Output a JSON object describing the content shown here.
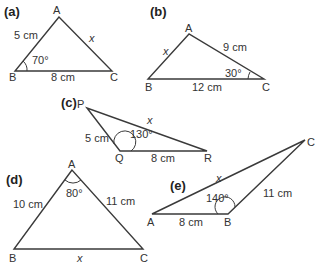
{
  "figures": [
    {
      "part": "(a)",
      "vertices": {
        "A": "A",
        "B": "B",
        "C": "C"
      },
      "sides": {
        "AB": "5 cm",
        "AC": "x",
        "BC": "8 cm"
      },
      "angle": {
        "at": "B",
        "value": "70°"
      }
    },
    {
      "part": "(b)",
      "vertices": {
        "A": "A",
        "B": "B",
        "C": "C"
      },
      "sides": {
        "AB": "x",
        "AC": "9 cm",
        "BC": "12 cm"
      },
      "angle": {
        "at": "C",
        "value": "30°"
      }
    },
    {
      "part": "(c)",
      "vertices": {
        "P": "P",
        "Q": "Q",
        "R": "R"
      },
      "sides": {
        "PQ": "5 cm",
        "PR": "x",
        "QR": "8 cm"
      },
      "angle": {
        "at": "Q",
        "value": "130°"
      }
    },
    {
      "part": "(d)",
      "vertices": {
        "A": "A",
        "B": "B",
        "C": "C"
      },
      "sides": {
        "AB": "10 cm",
        "AC": "11 cm",
        "BC": "x"
      },
      "angle": {
        "at": "A",
        "value": "80°"
      }
    },
    {
      "part": "(e)",
      "vertices": {
        "A": "A",
        "B": "B",
        "C": "C"
      },
      "sides": {
        "AB": "8 cm",
        "BC": "11 cm",
        "AC": "x"
      },
      "angle": {
        "at": "B",
        "value": "140°"
      }
    }
  ]
}
